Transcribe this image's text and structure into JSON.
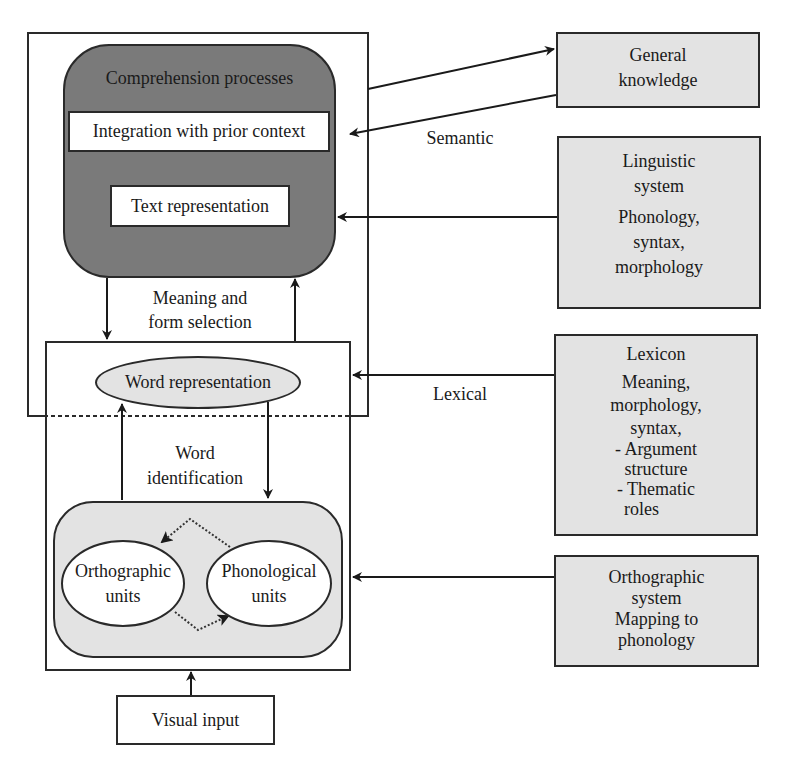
{
  "diagram": {
    "left_panel": {
      "comprehension": {
        "title": "Comprehension processes",
        "integration": "Integration with prior context",
        "text_representation": "Text representation"
      },
      "meaning_selection": {
        "line1": "Meaning and",
        "line2": "form selection"
      },
      "word_box": {
        "word_representation": "Word representation",
        "word_identification": {
          "line1": "Word",
          "line2": "identification"
        },
        "orthographic_units": {
          "line1": "Orthographic",
          "line2": "units"
        },
        "phonological_units": {
          "line1": "Phonological",
          "line2": "units"
        }
      },
      "visual_input": "Visual input"
    },
    "connector_labels": {
      "semantic": "Semantic",
      "lexical": "Lexical"
    },
    "knowledge_sources": [
      {
        "lines": [
          "General",
          "knowledge"
        ]
      },
      {
        "title_lines": [
          "Linguistic",
          "system"
        ],
        "detail_lines": [
          "Phonology,",
          "syntax,",
          "morphology"
        ]
      },
      {
        "title_lines": [
          "Lexicon"
        ],
        "detail_lines": [
          "Meaning,",
          "morphology,",
          "syntax,",
          "- Argument",
          "structure",
          "- Thematic",
          "roles"
        ]
      },
      {
        "lines": [
          "Orthographic",
          "system",
          "Mapping to",
          "phonology"
        ]
      }
    ],
    "colors": {
      "comprehension_fill": "#7a7a7a",
      "light_fill": "#e3e3e3",
      "stroke": "#2a2a2a"
    }
  }
}
